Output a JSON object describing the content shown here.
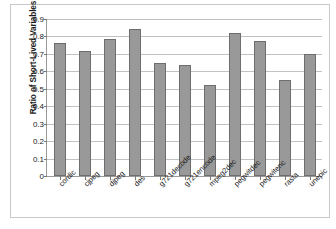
{
  "chart_data": {
    "type": "bar",
    "title": "",
    "xlabel": "",
    "ylabel": "Ratio of Short-Lived Variables",
    "ylim": [
      0,
      0.9
    ],
    "ytick_labels": [
      "0.9",
      "0.8",
      "0.7",
      "0.6",
      "0.5",
      "0.4",
      "0.3",
      "0.2",
      "0.1",
      "0"
    ],
    "ytick_values": [
      0.9,
      0.8,
      0.7,
      0.6,
      0.5,
      0.4,
      0.3,
      0.2,
      0.1,
      0
    ],
    "grid": "horizontal",
    "legend": "none",
    "bar_color": "#999999",
    "bar_edge_color": "#6e6e6e",
    "categories": [
      "cordic",
      "cjpeg",
      "djpeg",
      "des",
      "g721decode",
      "g721encode",
      "mpeg2dec",
      "pegwitdec",
      "pegwitenc",
      "rasta",
      "unepic"
    ],
    "values": [
      0.765,
      0.715,
      0.785,
      0.84,
      0.65,
      0.635,
      0.52,
      0.82,
      0.775,
      0.55,
      0.7
    ]
  }
}
